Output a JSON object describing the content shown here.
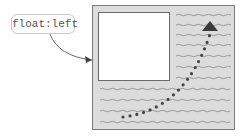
{
  "callout": {
    "label": "float:left"
  },
  "diagram": {
    "container": "text-container",
    "floated_box": "float-box",
    "flow_arrow": "text-flow-arrow",
    "colors": {
      "container_bg": "#dcdcdc",
      "border": "#7a7a7a",
      "arrow": "#444444"
    }
  }
}
